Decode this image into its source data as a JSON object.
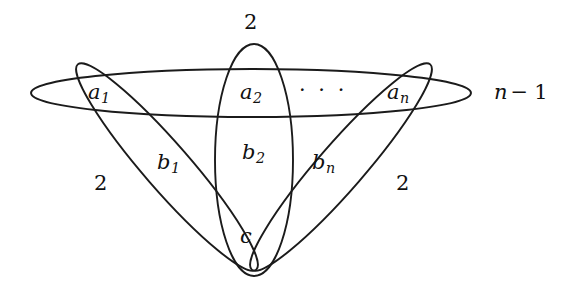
{
  "figure": {
    "type": "venn-diagram",
    "stroke_color": "#1b1b1b",
    "background_color": "#ffffff",
    "width": 586,
    "height": 304
  },
  "labels": {
    "top_multiplicity": "2",
    "left_multiplicity": "2",
    "right_multiplicity": "2",
    "a1": {
      "base": "a",
      "sub": "1"
    },
    "a2": {
      "base": "a",
      "sub": "2"
    },
    "an": {
      "base": "a",
      "sub": "n"
    },
    "b1": {
      "base": "b",
      "sub": "1"
    },
    "b2": {
      "base": "b",
      "sub": "2"
    },
    "bn": {
      "base": "b",
      "sub": "n"
    },
    "c": "c",
    "ellipsis": "· · ·",
    "n_minus_1": {
      "base": "n",
      "op": "−",
      "tail": "1"
    }
  }
}
